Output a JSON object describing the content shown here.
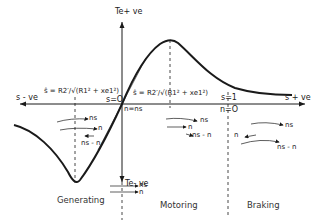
{
  "diagram": {
    "type": "torque-slip characteristic",
    "axes": {
      "y_positive_label": "Te+ ve",
      "y_negative_label": "Te- ve",
      "x_negative_label": "s - ve",
      "x_positive_label": "s + ve",
      "origin_slip_label": "s=O",
      "origin_speed_label": "n=ns",
      "s_one_label": "s=1",
      "n_zero_label": "n=O"
    },
    "max_slip_labels": {
      "generating": "ŝ = R2′/√(R1² + xe1²)",
      "motoring": "ŝ = R2′/√(R1² + xe1²)"
    },
    "regions": [
      {
        "name": "Generating",
        "arrows": [
          "ns",
          "n",
          "ns - n"
        ]
      },
      {
        "name": "Motoring",
        "arrows": [
          "ns",
          "n",
          "ns - n"
        ]
      },
      {
        "name": "Braking",
        "arrows": [
          "ns",
          "n",
          "ns - n"
        ]
      }
    ],
    "below_origin_arrows": [
      "ns",
      "n"
    ],
    "colors": {
      "line": "#1a1a1a",
      "background": "#ffffff"
    }
  }
}
